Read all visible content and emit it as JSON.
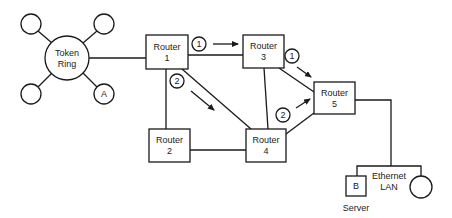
{
  "token_ring": {
    "label_line1": "Token",
    "label_line2": "Ring",
    "station_a_label": "A"
  },
  "routers": [
    {
      "id": "1",
      "label_line1": "Router",
      "label_line2": "1"
    },
    {
      "id": "2",
      "label_line1": "Router",
      "label_line2": "2"
    },
    {
      "id": "3",
      "label_line1": "Router",
      "label_line2": "3"
    },
    {
      "id": "4",
      "label_line1": "Router",
      "label_line2": "4"
    },
    {
      "id": "5",
      "label_line1": "Router",
      "label_line2": "5"
    }
  ],
  "paths": {
    "path1_label": "1",
    "path2_label": "2"
  },
  "ethernet": {
    "label_line1": "Ethernet",
    "label_line2": "LAN",
    "server_box_label": "B",
    "server_caption": "Server"
  },
  "colors": {
    "stroke": "#1a1a1a",
    "background": "#ffffff"
  }
}
